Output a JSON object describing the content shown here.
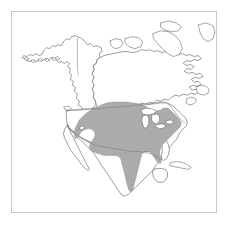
{
  "figure": {
    "type": "range-map",
    "region": "North America",
    "frame": {
      "color": "#c9c9c9",
      "x": 11,
      "y": 11,
      "width": 206,
      "height": 202
    },
    "background_color": "#ffffff"
  },
  "map": {
    "projection_hint": "conic",
    "outline_color": "#4a4a4a",
    "border_color": "#6e6e6e",
    "landmasses": [
      "Alaska",
      "Canada",
      "Canadian Arctic Archipelago",
      "Greenland edge",
      "United States",
      "Mexico",
      "Central America",
      "Cuba",
      "Baja California",
      "Newfoundland",
      "Nova Scotia",
      "Vancouver Island",
      "Aleutian Islands",
      "Florida Peninsula",
      "Yucatan Peninsula"
    ],
    "water_features": [
      "Hudson Bay",
      "Great Lakes",
      "Gulf of Mexico",
      "Gulf of California",
      "Great Salt Lake"
    ],
    "political_borders": [
      "United States - Canada",
      "United States - Mexico"
    ]
  },
  "range": {
    "label": "distribution range",
    "fill_color": "#ababab",
    "edge_color": "#8c8c8c",
    "coverage": "Eastern and central United States extending south along eastern Mexico to the Yucatan region",
    "excluded_areas": [
      "Great Lakes",
      "southern Florida peninsula",
      "western United States",
      "Baja California",
      "Canada interior"
    ]
  },
  "legend": {
    "present": false,
    "items": []
  },
  "labels": {
    "title": "",
    "caption": "",
    "annotations": []
  }
}
